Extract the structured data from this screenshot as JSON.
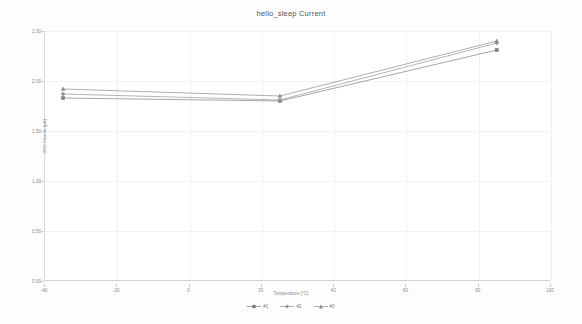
{
  "chart_data": {
    "type": "line",
    "title": "hello_sleep Current",
    "xlabel": "Temperature [°C]",
    "ylabel": "VDD Current [µA]",
    "xlim": [
      -40,
      100
    ],
    "ylim": [
      0.0,
      2.5
    ],
    "grid": true,
    "legend_position": "bottom",
    "xticks": [
      "-40",
      "-20",
      "0",
      "20",
      "40",
      "60",
      "80",
      "100"
    ],
    "xtick_values": [
      -40,
      -20,
      0,
      20,
      40,
      60,
      80,
      100
    ],
    "yticks": [
      "0.00",
      "0.50",
      "1.00",
      "1.50",
      "2.00",
      "2.50"
    ],
    "ytick_values": [
      0.0,
      0.5,
      1.0,
      1.5,
      2.0,
      2.5
    ],
    "x": [
      -35,
      25,
      85
    ],
    "series": [
      {
        "name": "#1",
        "marker": "square",
        "color": "#808080",
        "values": [
          1.83,
          1.8,
          2.31
        ]
      },
      {
        "name": "#2",
        "marker": "diamond",
        "color": "#949494",
        "values": [
          1.87,
          1.81,
          2.38
        ]
      },
      {
        "name": "#3",
        "marker": "triangle",
        "color": "#8c8c8c",
        "values": [
          1.92,
          1.85,
          2.4
        ]
      }
    ]
  },
  "legend": {
    "items": [
      {
        "label": "#1"
      },
      {
        "label": "#2"
      },
      {
        "label": "#3"
      }
    ]
  }
}
